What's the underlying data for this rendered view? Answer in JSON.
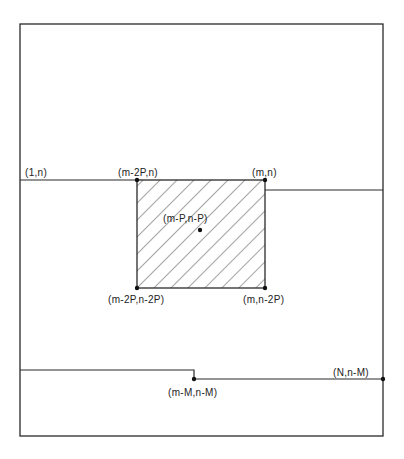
{
  "diagram": {
    "colors": {
      "stroke": "#2a2a2a",
      "background": "#ffffff",
      "hatch": "#3a3a3a"
    },
    "outer_frame": {
      "x1": 20,
      "y1": 24,
      "x2": 383,
      "y2": 436
    },
    "shaded_box": {
      "x1": 137,
      "y1": 180,
      "x2": 265,
      "y2": 288
    },
    "labels": {
      "top_left_line": "(1,n)",
      "box_top_left": "(m-2P,n)",
      "box_top_right": "(m,n)",
      "box_center": "(m-P,n-P)",
      "box_bottom_left": "(m-2P,n-2P)",
      "box_bottom_right": "(m,n-2P)",
      "lower_step": "(m-M,n-M)",
      "lower_right": "(N,n-M)"
    }
  }
}
